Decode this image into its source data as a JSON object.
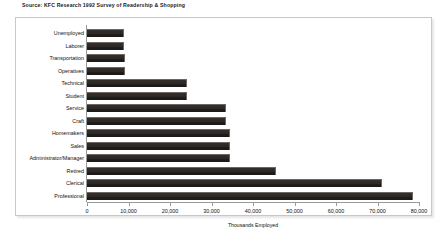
{
  "source_note": "Source: KFC Research 1992 Survey of Readership & Shopping",
  "chart_data": {
    "type": "bar",
    "orientation": "horizontal",
    "title": "",
    "xlabel": "Thousands Employed",
    "ylabel": "",
    "xlim": [
      0,
      80000
    ],
    "xticks": [
      0,
      10000,
      20000,
      30000,
      40000,
      50000,
      60000,
      70000,
      80000
    ],
    "xticklabels": [
      "0",
      "10,000",
      "20,000",
      "30,000",
      "40,000",
      "50,000",
      "60,000",
      "70,000",
      "80,000"
    ],
    "grid": false,
    "legend": false,
    "bar_color": "#2b2724",
    "bar_highlight_color": "#6f6662",
    "frame_color": "#c8c8c8",
    "categories": [
      "Unemployed",
      "Laborer",
      "Transportation",
      "Operatives",
      "Technical",
      "Student",
      "Service",
      "Craft",
      "Homemakers",
      "Sales",
      "Administrator/Manager",
      "Retired",
      "Clerical",
      "Professional"
    ],
    "values": [
      9000,
      9000,
      9200,
      9200,
      24000,
      24000,
      33500,
      33500,
      34500,
      34500,
      34500,
      45500,
      71000,
      78500
    ]
  }
}
